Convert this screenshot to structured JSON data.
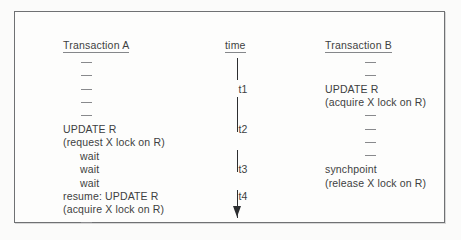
{
  "figure": {
    "type": "transaction-timeline-diagram",
    "columns": {
      "left": {
        "header": "Transaction A"
      },
      "center": {
        "header": "time"
      },
      "right": {
        "header": "Transaction B"
      }
    },
    "time_marks": [
      "t1",
      "t2",
      "t3",
      "t4"
    ],
    "axis": {
      "direction": "downward",
      "arrow": "arrowhead-down"
    },
    "rows": [
      {
        "a": "—",
        "time": "",
        "b": "—"
      },
      {
        "a": "—",
        "time": "",
        "b": "—"
      },
      {
        "a": "—",
        "time": "t1",
        "b": "UPDATE R"
      },
      {
        "a": "—",
        "time": "",
        "b": "(acquire X lock on R)"
      },
      {
        "a": "—",
        "time": "",
        "b": "—"
      },
      {
        "a": "UPDATE R",
        "time": "t2",
        "b": "—"
      },
      {
        "a": "(request X lock on R)",
        "time": "",
        "b": "—"
      },
      {
        "a": "wait",
        "time": "",
        "b": "—"
      },
      {
        "a": "wait",
        "time": "t3",
        "b": "synchpoint"
      },
      {
        "a": "wait",
        "time": "",
        "b": "(release X lock on R)"
      },
      {
        "a": "resume: UPDATE R",
        "time": "t4",
        "b": ""
      },
      {
        "a": "(acquire X lock on R)",
        "time": "",
        "b": ""
      },
      {
        "a": "—",
        "time": "",
        "b": ""
      }
    ]
  },
  "colors": {
    "text": "#3d3f41",
    "frame": "#6f7173",
    "axis": "#2c2e30",
    "background": "#fdfdfc"
  }
}
